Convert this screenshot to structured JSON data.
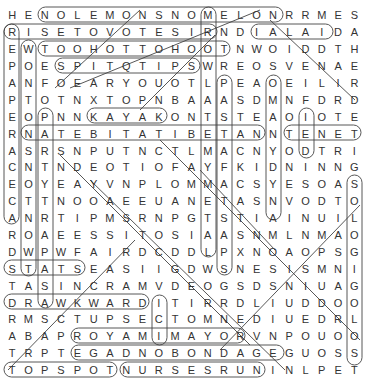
{
  "puzzle": {
    "type": "word-search",
    "rows": 22,
    "cols": 22,
    "grid": [
      "HENOLEMONSNOMELONRRMES",
      "RISETOVOTESIRNDIALAIDA",
      "EWTOOHOTTOHOOTNWOIDDTH",
      "POESPITQTIPSWREOSVENAE",
      "ANFOEARYOUOTLPEAOEILIR",
      "PTOTNXTOPNBAAASDMNFDRD",
      "EOPNNKAYAKONTSTEAOIOTE",
      "RNATEBITATIBETANNTENET",
      "ASRSNPUTNCTLMACNYODTRI",
      "CNTNDEOTIOFAYFKIDNINNG",
      "EOYEAYVNPLOMMACSYESOAS",
      "CTTNOOAEEUANETASNVODTO",
      "ANRTIPMSRNPGTSTIAINUIL",
      "ROAEESSITOSIAASNMLNMAO",
      "DWPWFAIRDCDDLPXNOAOPSG",
      "STATSEASIIGDWSNESISMNI",
      "TASINCRAMVDEOGSDSNIUAG",
      "DRAWKWARDITIRRDLIUDDOO",
      "RMSCTUPSECTOMNEDIUEDRL",
      "ABAPROYAMIMAYORVNPOUOO",
      "TRPTEGADNOBONDAGEGUOSS",
      "TOPSPOTNURSESRUNINLPET"
    ],
    "found_words_circled": [
      "NOLEMONSNOMELON",
      "RISETOVOTESIR",
      "DIALAID",
      "TOOHOTTOHOOT",
      "SPITQTIPS",
      "KAYAK",
      "NATEBITATIBETAN",
      "TENET",
      "DRAWKWARD",
      "ROYAMIMAYOR",
      "EGADNOBONDAGE",
      "TOPSPOT",
      "NURSESRUN",
      "STATS",
      "CIVIC",
      "REPAPER",
      "WONTON",
      "RACECAR"
    ]
  }
}
